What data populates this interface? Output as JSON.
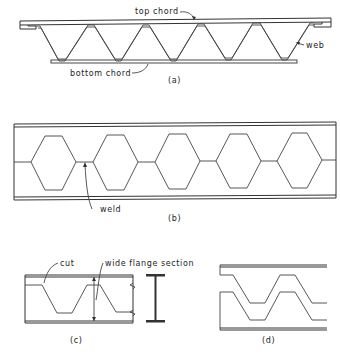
{
  "figure": {
    "panel_a": {
      "caption": "(a)",
      "labels": {
        "top_chord": "top chord",
        "web": "web",
        "bottom_chord": "bottom chord"
      }
    },
    "panel_b": {
      "caption": "(b)",
      "labels": {
        "weld": "weld"
      }
    },
    "panel_c": {
      "caption": "(c)",
      "labels": {
        "cut": "cut",
        "wide_flange_section": "wide flange section"
      }
    },
    "panel_d": {
      "caption": "(d)"
    }
  },
  "colors": {
    "ink": "#333333",
    "paper": "#ffffff"
  }
}
